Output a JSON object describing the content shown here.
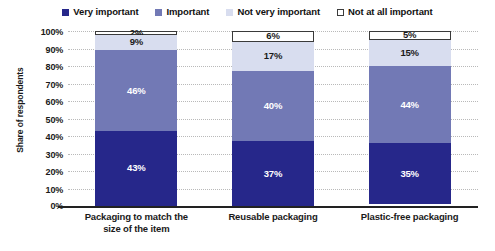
{
  "chart_data": {
    "type": "bar",
    "subtype": "stacked-100-percent-column",
    "title": "",
    "xlabel": "",
    "ylabel": "Share of respondents",
    "ylim": [
      0,
      100
    ],
    "ytick_labels": [
      "100%",
      "90%",
      "80%",
      "70%",
      "60%",
      "50%",
      "40%",
      "30%",
      "20%",
      "10%",
      "0%"
    ],
    "ytick_values": [
      100,
      90,
      80,
      70,
      60,
      50,
      40,
      30,
      20,
      10,
      0
    ],
    "grid": true,
    "legend_position": "top",
    "categories": [
      "Packaging to match the size of the item",
      "Reusable packaging",
      "Plastic-free packaging"
    ],
    "series": [
      {
        "name": "Very important",
        "color": "#26278a",
        "values": [
          43,
          37,
          35
        ],
        "labels": [
          "43%",
          "37%",
          "35%"
        ]
      },
      {
        "name": "Important",
        "color": "#7279b5",
        "values": [
          46,
          40,
          44
        ],
        "labels": [
          "46%",
          "40%",
          "44%"
        ]
      },
      {
        "name": "Not very important",
        "color": "#d8ddef",
        "values": [
          9,
          17,
          15
        ],
        "labels": [
          "9%",
          "17%",
          "15%"
        ]
      },
      {
        "name": "Not at all important",
        "color": "#ffffff",
        "values": [
          2,
          6,
          5
        ],
        "labels": [
          "2%",
          "6%",
          "5%"
        ]
      }
    ]
  },
  "legend": {
    "items": [
      {
        "label": "Very important"
      },
      {
        "label": "Important"
      },
      {
        "label": "Not very important"
      },
      {
        "label": "Not at all important"
      }
    ]
  },
  "category_lines": [
    [
      "Packaging to match the",
      "size of the item"
    ],
    [
      "Reusable packaging",
      ""
    ],
    [
      "Plastic-free packaging",
      ""
    ]
  ]
}
